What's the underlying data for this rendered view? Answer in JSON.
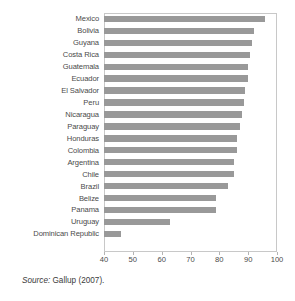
{
  "figure": {
    "source_note_prefix": "Source:",
    "source_note_text": " Gallup (2007)."
  },
  "chart_data": {
    "type": "bar",
    "orientation": "horizontal",
    "title": "",
    "subtitle": "",
    "xlabel": "",
    "ylabel": "",
    "xlim": [
      40,
      100
    ],
    "xticks": [
      40,
      50,
      60,
      70,
      80,
      90,
      100
    ],
    "xtick_labels": [
      "40",
      "50",
      "60",
      "70",
      "80",
      "90",
      "100"
    ],
    "grid": false,
    "legend": false,
    "bar_color": "#999999",
    "frame_color": "#c8c8c8",
    "categories": [
      "Mexico",
      "Bolivia",
      "Guyana",
      "Costa Rica",
      "Guatemala",
      "Ecuador",
      "El Salvador",
      "Peru",
      "Nicaragua",
      "Paraguay",
      "Honduras",
      "Colombia",
      "Argentina",
      "Chile",
      "Brazil",
      "Belize",
      "Panama",
      "Uruguay",
      "Dominican Republic"
    ],
    "values": [
      96,
      92,
      91.5,
      90.5,
      90,
      90,
      89,
      88.5,
      88,
      87,
      86,
      86,
      85,
      85,
      83,
      79,
      79,
      63,
      46
    ]
  }
}
